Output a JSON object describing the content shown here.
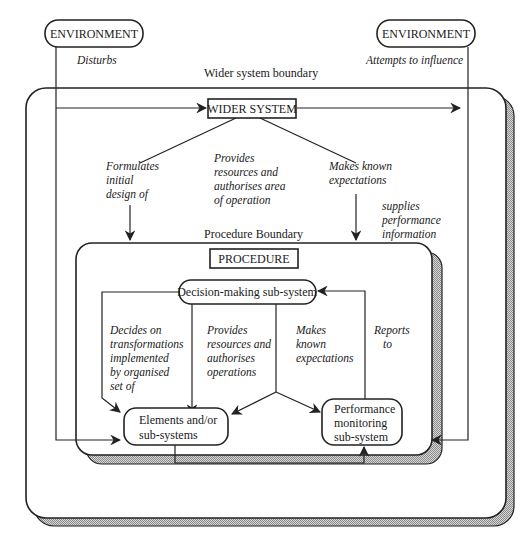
{
  "diagram": {
    "environment_left": "ENVIRONMENT",
    "environment_right": "ENVIRONMENT",
    "disturbs": "Disturbs",
    "attempts_to_influence": "Attempts to influence",
    "wider_system_boundary": "Wider system boundary",
    "wider_system": "WIDER SYSTEM",
    "formulates": [
      "Formulates",
      "initial",
      "design of"
    ],
    "provides_resources_area": [
      "Provides",
      "resources and",
      "authorises area",
      "of operation"
    ],
    "makes_known_outer": [
      "Makes known",
      "expectations"
    ],
    "supplies_performance": [
      "supplies",
      "performance",
      "information"
    ],
    "procedure_boundary": "Procedure Boundary",
    "procedure": "PROCEDURE",
    "decision_making": "Decision-making sub-system",
    "decides_on": [
      "Decides on",
      "transformations",
      "implemented",
      "by organised",
      "set  of"
    ],
    "provides_resources_ops": [
      "Provides",
      "resources and",
      "authorises",
      "operations"
    ],
    "makes_known_inner": [
      "Makes",
      "known",
      "expectations"
    ],
    "reports_to": [
      "Reports",
      "to"
    ],
    "elements": [
      "Elements and/or",
      "sub-systems"
    ],
    "performance_monitoring": [
      "Performance",
      "monitoring",
      "sub-system"
    ]
  }
}
